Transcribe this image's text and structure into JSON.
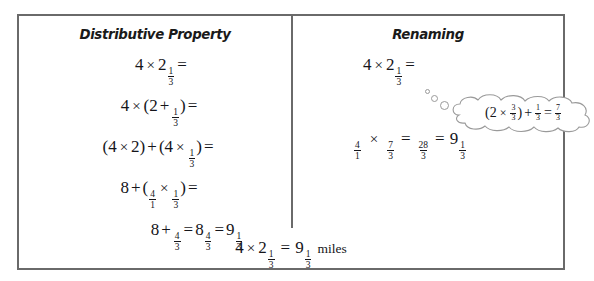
{
  "problem": {
    "left_column": {
      "title": "Distributive Property",
      "lines": [
        {
          "id": "line-1",
          "text": "4 × 2 1/3 ="
        },
        {
          "id": "line-2",
          "text": "4 × (2 + 1/3) ="
        },
        {
          "id": "line-3",
          "text": "(4 × 2) + (4 × 1/3) ="
        },
        {
          "id": "line-4",
          "text": "8 + (4/1 × 1/3) ="
        },
        {
          "id": "line-5",
          "text": "8 + 4/3 = 8 4/3 = 9 1/3"
        }
      ]
    },
    "right_column": {
      "title": "Renaming",
      "lines": [
        {
          "id": "line-1",
          "text": "4 × 2 1/3 ="
        },
        {
          "id": "line-2",
          "text": "4/1 × 7/3 = 28/3 = 9 1/3"
        }
      ],
      "thought_bubble": {
        "text": "(2 × 3/3) + 1/3 = 7/3"
      }
    },
    "summary": {
      "equation": "4 × 2 1/3 = 9 1/3",
      "units": "miles"
    },
    "symbols": {
      "multiply": "×",
      "plus": "+",
      "equals": "=",
      "lparen": "(",
      "rparen": ")"
    },
    "numbers": {
      "four": "4",
      "two": "2",
      "one": "1",
      "three": "3",
      "eight": "8",
      "nine": "9",
      "seven": "7",
      "twenty_eight": "28"
    },
    "colors": {
      "border": "#6a6a6a",
      "text": "#15151a",
      "bubble_outline": "#9a9a9a",
      "background": "#ffffff"
    }
  }
}
